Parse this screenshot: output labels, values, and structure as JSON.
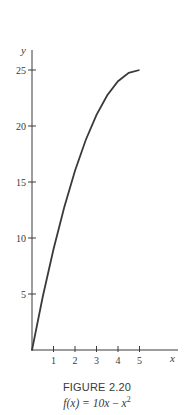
{
  "chart_data": {
    "type": "line",
    "title": "FIGURE 2.20",
    "subtitle": "f(x) = 10x − x²",
    "xlabel": "x",
    "ylabel": "y",
    "xlim": [
      0,
      5
    ],
    "ylim": [
      0,
      25
    ],
    "x_ticks": [
      1,
      2,
      3,
      4,
      5
    ],
    "y_ticks": [
      5,
      10,
      15,
      20,
      25
    ],
    "grid": false,
    "legend": null,
    "series": [
      {
        "name": "f(x) = 10x − x²",
        "x": [
          0,
          0.5,
          1,
          1.5,
          2,
          2.5,
          3,
          3.5,
          4,
          4.5,
          5
        ],
        "values": [
          0,
          4.75,
          9,
          12.75,
          16,
          18.75,
          21,
          22.75,
          24,
          24.75,
          25
        ]
      }
    ]
  },
  "caption": {
    "figure_label": "FIGURE 2.20",
    "formula_lhs": "f(x) = 10",
    "formula_var": "x",
    "formula_minus": " − ",
    "formula_rhs_var": "x",
    "formula_exp": "2"
  },
  "axes": {
    "x_label": "x",
    "y_label": "y",
    "x_tick_labels": [
      "1",
      "2",
      "3",
      "4",
      "5"
    ],
    "y_tick_labels": [
      "5",
      "10",
      "15",
      "20",
      "25"
    ]
  },
  "colors": {
    "ink": "#3a3a3a",
    "background": "#ffffff"
  }
}
